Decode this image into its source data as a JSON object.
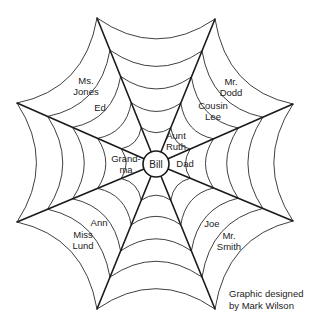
{
  "center": {
    "name": "Bill",
    "x": 156,
    "y": 164,
    "radius": 13
  },
  "spokes": [
    {
      "x": 97,
      "y": 18
    },
    {
      "x": 215,
      "y": 19
    },
    {
      "x": 293,
      "y": 104
    },
    {
      "x": 293,
      "y": 221
    },
    {
      "x": 215,
      "y": 309
    },
    {
      "x": 97,
      "y": 309
    },
    {
      "x": 17,
      "y": 222
    },
    {
      "x": 17,
      "y": 103
    }
  ],
  "ring_fractions": [
    0.25,
    0.42,
    0.6,
    0.78,
    1.0
  ],
  "labels": [
    {
      "id": "ms-jones",
      "lines": [
        "Ms.",
        "Jones"
      ],
      "x": 86,
      "y": 86
    },
    {
      "id": "ed",
      "lines": [
        "Ed"
      ],
      "x": 100,
      "y": 108
    },
    {
      "id": "mr-dodd",
      "lines": [
        "Mr.",
        "Dodd"
      ],
      "x": 231,
      "y": 87
    },
    {
      "id": "cousin-lee",
      "lines": [
        "Cousin",
        "Lee"
      ],
      "x": 213,
      "y": 111
    },
    {
      "id": "aunt-ruth",
      "lines": [
        "Aunt",
        "Ruth"
      ],
      "x": 176,
      "y": 141
    },
    {
      "id": "dad",
      "lines": [
        "Dad"
      ],
      "x": 185,
      "y": 164
    },
    {
      "id": "grandma",
      "lines": [
        "Grand-",
        "ma"
      ],
      "x": 126,
      "y": 164
    },
    {
      "id": "ann",
      "lines": [
        "Ann"
      ],
      "x": 99,
      "y": 223
    },
    {
      "id": "miss-lund",
      "lines": [
        "Miss",
        "Lund"
      ],
      "x": 83,
      "y": 240
    },
    {
      "id": "joe",
      "lines": [
        "Joe"
      ],
      "x": 212,
      "y": 224
    },
    {
      "id": "mr-smith",
      "lines": [
        "Mr.",
        "Smith"
      ],
      "x": 229,
      "y": 241
    }
  ],
  "credit": {
    "line1": "Graphic designed",
    "line2": "by Mark Wilson"
  }
}
